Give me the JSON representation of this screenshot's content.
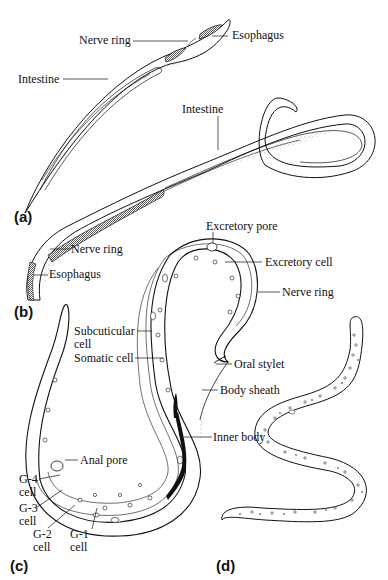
{
  "figure": {
    "panels": [
      {
        "id": "a",
        "marker": "(a)",
        "labels": [
          "Nerve ring",
          "Esophagus",
          "Intestine"
        ]
      },
      {
        "id": "b",
        "marker": "(b)",
        "labels": [
          "Intestine",
          "Nerve ring",
          "Esophagus"
        ]
      },
      {
        "id": "c",
        "marker": "(c)",
        "labels": [
          "Excretory pore",
          "Excretory cell",
          "Nerve ring",
          "Subcuticular cell",
          "Somatic cell",
          "Oral stylet",
          "Body sheath",
          "Anal pore",
          "Inner body",
          "G-4 cell",
          "G-3 cell",
          "G-2 cell",
          "G-1 cell"
        ]
      },
      {
        "id": "d",
        "marker": "(d)",
        "labels": []
      }
    ]
  },
  "labels": {
    "a_nerve_ring": "Nerve ring",
    "a_esophagus": "Esophagus",
    "a_intestine": "Intestine",
    "b_intestine": "Intestine",
    "b_nerve_ring": "Nerve ring",
    "b_esophagus": "Esophagus",
    "c_excretory_pore": "Excretory pore",
    "c_excretory_cell": "Excretory cell",
    "c_nerve_ring": "Nerve ring",
    "c_subcuticular_1": "Subcuticular",
    "c_subcuticular_2": "cell",
    "c_somatic_cell": "Somatic cell",
    "c_oral_stylet": "Oral stylet",
    "c_body_sheath": "Body sheath",
    "c_anal_pore": "Anal pore",
    "c_inner_body": "Inner body",
    "c_g4_1": "G-4",
    "c_g4_2": "cell",
    "c_g3_1": "G-3",
    "c_g3_2": "cell",
    "c_g2_1": "G-2",
    "c_g2_2": "cell",
    "c_g1_1": "G-1",
    "c_g1_2": "cell"
  },
  "markers": {
    "a": "(a)",
    "b": "(b)",
    "c": "(c)",
    "d": "(d)"
  }
}
